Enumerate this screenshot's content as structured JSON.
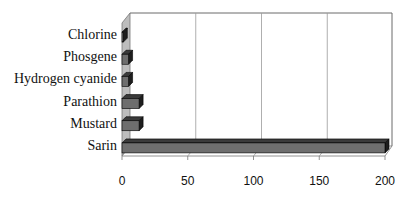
{
  "chart_data": {
    "type": "bar",
    "orientation": "horizontal",
    "style": "3d",
    "title": "",
    "xlabel": "",
    "ylabel": "",
    "categories": [
      "Chlorine",
      "Phosgene",
      "Hydrogen cyanide",
      "Parathion",
      "Mustard",
      "Sarin"
    ],
    "values": [
      1,
      5,
      5,
      13,
      13,
      200
    ],
    "xlim": [
      0,
      200
    ],
    "x_ticks": [
      "0",
      "50",
      "100",
      "150",
      "200"
    ],
    "grid": "vertical gridlines at 50, 100, 150",
    "legend": "none",
    "colors": {
      "bar_front": "#6e6e6e",
      "bar_top": "#3a3a3a",
      "bar_side": "#1e1e1e",
      "side_wall": "#bdbdbd",
      "gridline": "#9a9a9a"
    }
  }
}
